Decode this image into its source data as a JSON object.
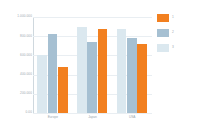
{
  "chart_data": {
    "type": "bar",
    "title": "",
    "xlabel": "",
    "ylabel": "",
    "categories": [
      "Europe",
      "Japan",
      "USA"
    ],
    "series": [
      {
        "name": "3",
        "color": "#dbe8ef",
        "values": [
          600000,
          900000,
          870000
        ]
      },
      {
        "name": "2",
        "color": "#a6c0d2",
        "values": [
          820000,
          740000,
          780000
        ]
      },
      {
        "name": "1",
        "color": "#f28020",
        "values": [
          480000,
          880000,
          720000
        ]
      }
    ],
    "ylim": [
      0,
      1000000
    ],
    "yticks": [
      0,
      200000,
      400000,
      600000,
      800000,
      1000000
    ],
    "ytick_labels": [
      "0.00",
      "200.000",
      "400.000",
      "600.000",
      "800.000",
      "1.000.000"
    ],
    "grid": true,
    "legend_position": "right"
  },
  "legend": {
    "items": [
      {
        "label": "1",
        "color": "#f28020"
      },
      {
        "label": "2",
        "color": "#a6c0d2"
      },
      {
        "label": "3",
        "color": "#dbe8ef"
      }
    ]
  },
  "axis": {
    "y_tick_labels": [
      "1.000.000",
      "800.000",
      "600.000",
      "400.000",
      "200.000",
      "0.00"
    ],
    "x_tick_labels": [
      "Europe",
      "Japan",
      "USA"
    ]
  },
  "colors": {
    "series_orange": "#f28020",
    "series_blue": "#a6c0d2",
    "series_light": "#dbe8ef",
    "grid": "#e9eef2",
    "axis": "#cfd8de",
    "tick_text": "#9aa6ae",
    "background": "#ffffff"
  }
}
